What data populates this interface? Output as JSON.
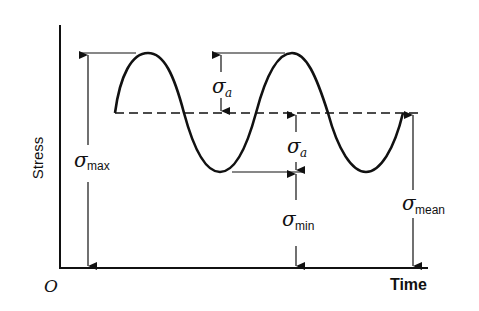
{
  "diagram": {
    "axes": {
      "y_label": "Stress",
      "x_label": "Time",
      "origin_label": "O"
    },
    "symbols": {
      "sigma": "σ",
      "amplitude_sub": "a",
      "max_sub": "max",
      "min_sub": "min",
      "mean_sub": "mean"
    },
    "annotations": [
      {
        "id": "sigma_max",
        "text": "σmax",
        "meaning": "maximum stress, from axis to peak"
      },
      {
        "id": "sigma_a_upper",
        "text": "σa",
        "meaning": "stress amplitude, mean to peak"
      },
      {
        "id": "sigma_a_lower",
        "text": "σa",
        "meaning": "stress amplitude, trough to mean"
      },
      {
        "id": "sigma_min",
        "text": "σmin",
        "meaning": "minimum stress, from axis to trough"
      },
      {
        "id": "sigma_mean",
        "text": "σmean",
        "meaning": "mean stress, from axis to dashed line"
      }
    ],
    "curve": {
      "type": "sinusoid",
      "cycles": 2,
      "start_phase": "mean, rising"
    },
    "mean_line": {
      "style": "dashed"
    }
  }
}
